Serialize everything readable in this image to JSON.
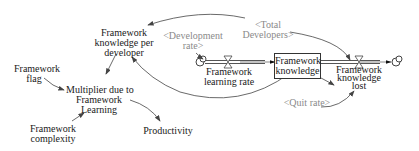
{
  "diagram": {
    "type": "stock-and-flow",
    "stocks": [
      {
        "id": "framework_knowledge",
        "label_line1": "Framework",
        "label_line2": "knowledge"
      }
    ],
    "flows": [
      {
        "id": "framework_learning_rate",
        "label_line1": "Framework",
        "label_line2": "learning rate"
      },
      {
        "id": "framework_knowledge_lost",
        "label_line1": "Framework",
        "label_line2": "knowledge",
        "label_line3": "lost"
      }
    ],
    "variables": [
      {
        "id": "framework_knowledge_per_developer",
        "label_line1": "Framework",
        "label_line2": "knowledge per",
        "label_line3": "developer"
      },
      {
        "id": "framework_flag",
        "label_line1": "Framework",
        "label_line2": "flag"
      },
      {
        "id": "multiplier",
        "label_line1": "Multiplier due to",
        "label_line2": "Framework",
        "label_line3": "Learning"
      },
      {
        "id": "framework_complexity",
        "label_line1": "Framework",
        "label_line2": "complexity"
      },
      {
        "id": "productivity",
        "label_line1": "Productivity"
      }
    ],
    "shadow_variables": [
      {
        "id": "development_rate",
        "label_line1": "<Development",
        "label_line2": "rate>"
      },
      {
        "id": "total_developers",
        "label_line1": "<Total",
        "label_line2": "Developers>"
      },
      {
        "id": "quit_rate",
        "label_line1": "<Quit rate>"
      }
    ],
    "colors": {
      "line": "#3a3a3a",
      "text": "#1a1a1a",
      "shadow_text": "#8a8a8a",
      "pipe": "#555555"
    }
  }
}
